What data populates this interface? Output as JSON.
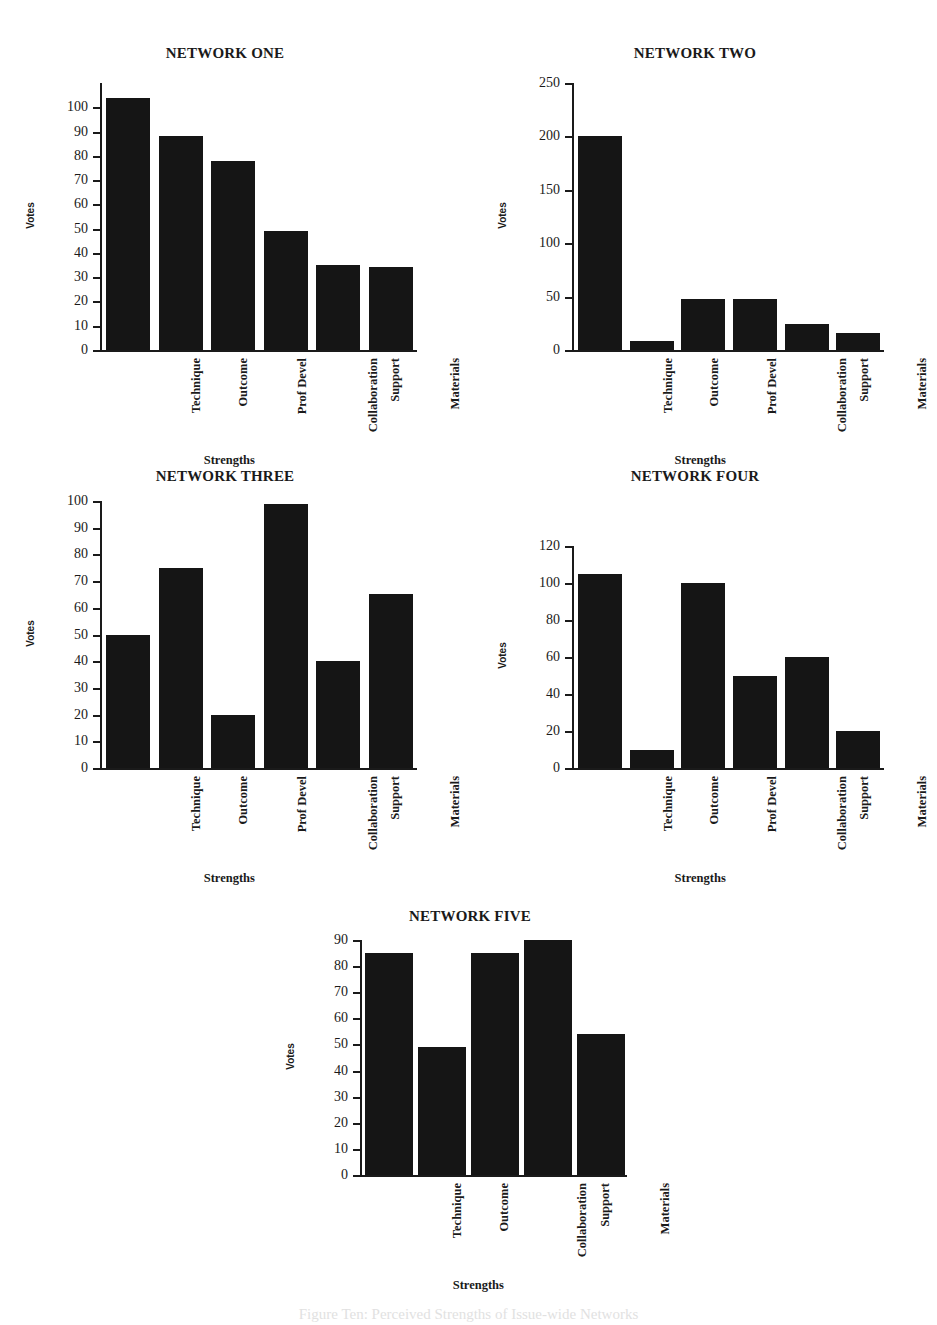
{
  "figure": {
    "bottom_caption": "Figure Ten: Perceived Strengths of Issue-wide Networks"
  },
  "common": {
    "xlabel": "Strengths",
    "ylabel": "Votes"
  },
  "chart_data": [
    {
      "type": "bar",
      "title": "NETWORK ONE",
      "xlabel": "Strengths",
      "ylabel": "Votes",
      "categories": [
        "Technique",
        "Outcome",
        "Prof Devel",
        "Collaboration",
        "Support",
        "Materials"
      ],
      "values": [
        104,
        88,
        78,
        49,
        35,
        34
      ],
      "ylim": [
        0,
        110
      ],
      "yticks": [
        0,
        10,
        20,
        30,
        40,
        50,
        60,
        70,
        80,
        90,
        100
      ],
      "ytick_labels": [
        "0",
        "10",
        "20",
        "30",
        "40",
        "50",
        "60",
        "70",
        "80",
        "90",
        "100"
      ],
      "grid": false,
      "legend": "none"
    },
    {
      "type": "bar",
      "title": "NETWORK TWO",
      "xlabel": "Strengths",
      "ylabel": "Votes",
      "categories": [
        "Technique",
        "Outcome",
        "Prof Devel",
        "Collaboration",
        "Support",
        "Materials"
      ],
      "values": [
        200,
        8,
        48,
        48,
        24,
        16
      ],
      "ylim": [
        0,
        250
      ],
      "yticks": [
        0,
        50,
        100,
        150,
        200,
        250
      ],
      "ytick_labels": [
        "0",
        "50",
        "100",
        "150",
        "200",
        "250"
      ],
      "grid": false,
      "legend": "none"
    },
    {
      "type": "bar",
      "title": "NETWORK THREE",
      "xlabel": "Strengths",
      "ylabel": "Votes",
      "categories": [
        "Technique",
        "Outcome",
        "Prof Devel",
        "Collaboration",
        "Support",
        "Materials"
      ],
      "values": [
        50,
        75,
        20,
        99,
        40,
        65
      ],
      "ylim": [
        0,
        100
      ],
      "yticks": [
        0,
        10,
        20,
        30,
        40,
        50,
        60,
        70,
        80,
        90,
        100
      ],
      "ytick_labels": [
        "0",
        "10",
        "20",
        "30",
        "40",
        "50",
        "60",
        "70",
        "80",
        "90",
        "100"
      ],
      "grid": false,
      "legend": "none"
    },
    {
      "type": "bar",
      "title": "NETWORK FOUR",
      "xlabel": "Strengths",
      "ylabel": "Votes",
      "categories": [
        "Technique",
        "Outcome",
        "Prof Devel",
        "Collaboration",
        "Support",
        "Materials"
      ],
      "values": [
        105,
        10,
        100,
        50,
        60,
        20
      ],
      "ylim": [
        0,
        120
      ],
      "yticks": [
        0,
        20,
        40,
        60,
        80,
        100,
        120
      ],
      "ytick_labels": [
        "0",
        "20",
        "40",
        "60",
        "80",
        "100",
        "120"
      ],
      "grid": false,
      "legend": "none"
    },
    {
      "type": "bar",
      "title": "NETWORK FIVE",
      "xlabel": "Strengths",
      "ylabel": "Votes",
      "categories": [
        "Technique",
        "Outcome",
        "Collaboration",
        "Support",
        "Materials"
      ],
      "values": [
        85,
        49,
        85,
        90,
        54
      ],
      "ylim": [
        0,
        90
      ],
      "yticks": [
        0,
        10,
        20,
        30,
        40,
        50,
        60,
        70,
        80,
        90
      ],
      "ytick_labels": [
        "0",
        "10",
        "20",
        "30",
        "40",
        "50",
        "60",
        "70",
        "80",
        "90"
      ],
      "grid": false,
      "legend": "none"
    }
  ],
  "layout": {
    "charts": [
      {
        "left": 30,
        "top": 45,
        "plot_left": 70,
        "plot_top": 38,
        "plot_w": 315,
        "plot_h": 267,
        "bar_w": 44,
        "title_w": 390
      },
      {
        "left": 500,
        "top": 45,
        "plot_left": 72,
        "plot_top": 38,
        "plot_w": 310,
        "plot_h": 267,
        "bar_w": 44,
        "title_w": 390
      },
      {
        "left": 30,
        "top": 468,
        "plot_left": 70,
        "plot_top": 33,
        "plot_w": 315,
        "plot_h": 267,
        "bar_w": 44,
        "title_w": 390
      },
      {
        "left": 500,
        "top": 468,
        "plot_left": 72,
        "plot_top": 78,
        "plot_w": 310,
        "plot_h": 222,
        "bar_w": 44,
        "title_w": 390
      },
      {
        "left": 260,
        "top": 908,
        "plot_left": 100,
        "plot_top": 32,
        "plot_w": 265,
        "plot_h": 235,
        "bar_w": 48,
        "title_w": 420
      }
    ]
  }
}
